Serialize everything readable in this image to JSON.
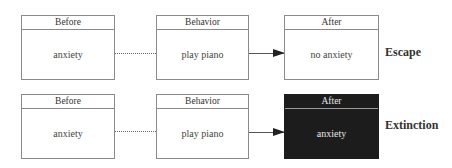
{
  "rows": [
    {
      "before": {
        "header": "Before",
        "content": "anxiety"
      },
      "behavior": {
        "header": "Behavior",
        "content": "play piano"
      },
      "after": {
        "header": "After",
        "content": "no anxiety"
      },
      "label": "Escape"
    },
    {
      "before": {
        "header": "Before",
        "content": "anxiety"
      },
      "behavior": {
        "header": "Behavior",
        "content": "play piano"
      },
      "after": {
        "header": "After",
        "content": "anxiety"
      },
      "label": "Extinction"
    }
  ],
  "colors": {
    "dark_box": "#1c1c1c",
    "border": "#8a8a8a"
  }
}
